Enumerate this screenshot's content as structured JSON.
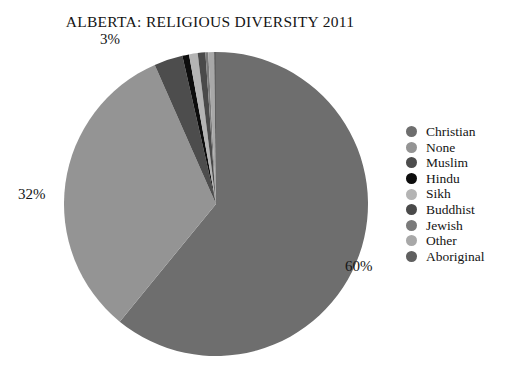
{
  "chart_data": {
    "type": "pie",
    "title": "ALBERTA: RELIGIOUS DIVERSITY 2011",
    "categories": [
      "Christian",
      "None",
      "Muslim",
      "Hindu",
      "Sikh",
      "Buddhist",
      "Jewish",
      "Other",
      "Aboriginal"
    ],
    "values": [
      60.0,
      32.0,
      3.0,
      0.7,
      0.9,
      0.8,
      0.3,
      0.6,
      0.2
    ],
    "value_unit": "percent",
    "data_labels": [
      {
        "category": "Christian",
        "text": "60%",
        "shown": true
      },
      {
        "category": "None",
        "text": "32%",
        "shown": true
      },
      {
        "category": "Muslim",
        "text": "3%",
        "shown": true
      }
    ],
    "colors": [
      "#6e6e6e",
      "#949494",
      "#4d4d4d",
      "#0d0d0d",
      "#b4b4b4",
      "#4a4a4a",
      "#7a7a7a",
      "#a8a8a8",
      "#606060"
    ],
    "start_angle_deg": 0,
    "direction": "clockwise",
    "legend_position": "right",
    "grid": false,
    "xlabel": "",
    "ylabel": ""
  },
  "header": {
    "title": "ALBERTA: RELIGIOUS DIVERSITY 2011"
  },
  "labels": {
    "christian_pct": "60%",
    "none_pct": "32%",
    "muslim_pct": "3%"
  },
  "legend": {
    "items": [
      {
        "label": "Christian",
        "color": "#6e6e6e"
      },
      {
        "label": "None",
        "color": "#949494"
      },
      {
        "label": "Muslim",
        "color": "#4d4d4d"
      },
      {
        "label": "Hindu",
        "color": "#0d0d0d"
      },
      {
        "label": "Sikh",
        "color": "#b4b4b4"
      },
      {
        "label": "Buddhist",
        "color": "#4a4a4a"
      },
      {
        "label": "Jewish",
        "color": "#7a7a7a"
      },
      {
        "label": "Other",
        "color": "#a8a8a8"
      },
      {
        "label": "Aboriginal",
        "color": "#606060"
      }
    ]
  }
}
